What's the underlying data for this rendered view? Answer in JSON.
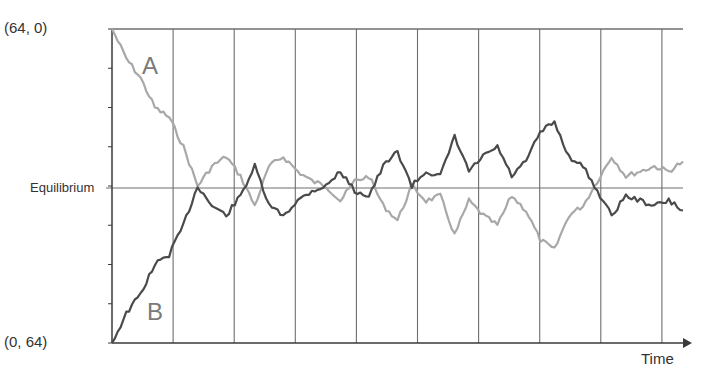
{
  "labels": {
    "top_left": "(64, 0)",
    "bottom_left": "(0, 64)",
    "equilibrium": "Equilibrium",
    "series_a": "A",
    "series_b": "B",
    "x_axis": "Time"
  },
  "colors": {
    "series_a": "#a8a8a8",
    "series_b": "#4a4a4a",
    "grid": "#6e6e6e",
    "axis": "#3a3a3a"
  },
  "chart_data": {
    "type": "line",
    "title": "",
    "xlabel": "Time",
    "ylabel": "",
    "y_top_label": "(64, 0)",
    "y_bottom_label": "(0, 64)",
    "y_mid_label": "Equilibrium",
    "ylim": [
      0,
      64
    ],
    "equilibrium": 32,
    "grid": {
      "vertical_lines": 9,
      "horizontal": false
    },
    "legend": "inline labels",
    "series": [
      {
        "name": "A",
        "color": "#a8a8a8",
        "description": "starts at 64, decays to equilibrium (32) then fluctuates around it, mirror image of B",
        "points": [
          [
            0,
            64
          ],
          [
            1,
            58
          ],
          [
            2,
            54
          ],
          [
            3,
            48
          ],
          [
            4,
            46
          ],
          [
            5,
            40
          ],
          [
            6,
            32
          ],
          [
            7,
            36
          ],
          [
            8,
            38
          ],
          [
            9,
            34
          ],
          [
            10,
            28
          ],
          [
            11,
            36
          ],
          [
            12,
            38
          ],
          [
            13,
            35
          ],
          [
            14,
            33
          ],
          [
            15,
            32
          ],
          [
            16,
            29
          ],
          [
            17,
            33
          ],
          [
            18,
            34
          ],
          [
            19,
            28
          ],
          [
            20,
            25
          ],
          [
            21,
            32
          ],
          [
            22,
            29
          ],
          [
            23,
            30
          ],
          [
            24,
            22
          ],
          [
            25,
            29
          ],
          [
            26,
            26
          ],
          [
            27,
            24
          ],
          [
            28,
            30
          ],
          [
            29,
            27
          ],
          [
            30,
            21
          ],
          [
            31,
            19
          ],
          [
            32,
            26
          ],
          [
            33,
            28
          ],
          [
            34,
            33
          ],
          [
            35,
            38
          ],
          [
            36,
            34
          ],
          [
            37,
            35
          ],
          [
            38,
            36
          ],
          [
            39,
            35
          ],
          [
            40,
            37
          ]
        ]
      },
      {
        "name": "B",
        "color": "#4a4a4a",
        "description": "starts at 0, rises to equilibrium (32) then fluctuates around it",
        "points": [
          [
            0,
            0
          ],
          [
            1,
            6
          ],
          [
            2,
            10
          ],
          [
            3,
            16
          ],
          [
            4,
            18
          ],
          [
            5,
            24
          ],
          [
            6,
            32
          ],
          [
            7,
            28
          ],
          [
            8,
            26
          ],
          [
            9,
            30
          ],
          [
            10,
            36
          ],
          [
            11,
            28
          ],
          [
            12,
            26
          ],
          [
            13,
            29
          ],
          [
            14,
            31
          ],
          [
            15,
            32
          ],
          [
            16,
            35
          ],
          [
            17,
            31
          ],
          [
            18,
            30
          ],
          [
            19,
            36
          ],
          [
            20,
            39
          ],
          [
            21,
            32
          ],
          [
            22,
            35
          ],
          [
            23,
            34
          ],
          [
            24,
            42
          ],
          [
            25,
            35
          ],
          [
            26,
            38
          ],
          [
            27,
            40
          ],
          [
            28,
            34
          ],
          [
            29,
            37
          ],
          [
            30,
            43
          ],
          [
            31,
            45
          ],
          [
            32,
            38
          ],
          [
            33,
            36
          ],
          [
            34,
            31
          ],
          [
            35,
            26
          ],
          [
            36,
            30
          ],
          [
            37,
            29
          ],
          [
            38,
            28
          ],
          [
            39,
            29
          ],
          [
            40,
            27
          ]
        ]
      }
    ]
  }
}
